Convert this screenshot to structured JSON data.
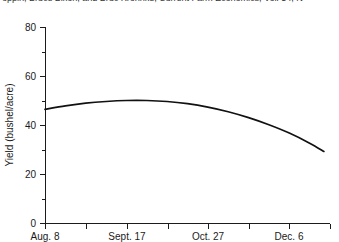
{
  "citation": {
    "text": "oppin, Bruce Bixon, and Bruc Krohnke, Current Farm Economics, Vol. 54, N"
  },
  "chart_data": {
    "type": "line",
    "title": "",
    "xlabel": "",
    "ylabel": "Yield (bushel/acre)",
    "ylim": [
      0,
      80
    ],
    "y_ticks": [
      0,
      20,
      40,
      60,
      80
    ],
    "y_tick_labels": [
      "0",
      "20",
      "40",
      "60",
      "80"
    ],
    "y_minor_ticks": [
      10,
      30,
      50,
      70
    ],
    "grid": false,
    "legend": null,
    "x_tick_labels": [
      "Aug. 8",
      "Sept. 17",
      "Oct. 27",
      "Dec. 6"
    ],
    "x_major_positions": [
      0,
      2,
      4,
      6
    ],
    "x_minor_positions": [
      1,
      3,
      5,
      7
    ],
    "x_axis_units": "planting date",
    "series": [
      {
        "name": "Yield",
        "x": [
          0.0,
          0.5,
          1.0,
          1.5,
          2.0,
          2.5,
          3.0,
          3.5,
          4.0,
          4.5,
          5.0,
          5.5,
          6.0,
          6.5,
          6.85
        ],
        "values": [
          46.4,
          47.8,
          48.9,
          49.6,
          50.0,
          50.0,
          49.6,
          48.7,
          47.3,
          45.4,
          43.0,
          40.1,
          36.7,
          32.6,
          29.2
        ]
      }
    ],
    "annotations": []
  },
  "axes_geometry": {
    "plot_left_px": 45,
    "plot_right_px": 330,
    "y_zero_px": 223,
    "y_top_px": 27
  }
}
